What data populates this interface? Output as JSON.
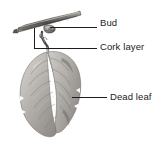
{
  "figure": {
    "background_color": "#ffffff",
    "ink_color": "#1c1c1c",
    "width": 161,
    "height": 153
  },
  "labels": [
    {
      "id": "bud",
      "text": "Bud",
      "leader": {
        "x1": 50,
        "y1": 27,
        "x2": 97,
        "y2": 27
      },
      "anchor": {
        "x": 50,
        "y": 27
      }
    },
    {
      "id": "cork-layer",
      "text": "Cork layer",
      "leader": {
        "x1": 34,
        "y1": 48,
        "x2": 97,
        "y2": 48
      },
      "bracket": {
        "x": 34,
        "y_top": 28,
        "y_bottom": 48
      },
      "anchor": {
        "x": 34,
        "y": 48
      }
    },
    {
      "id": "dead-leaf",
      "text": "Dead leaf",
      "leader": {
        "x1": 72,
        "y1": 97,
        "x2": 107,
        "y2": 97
      },
      "anchor": {
        "x": 72,
        "y": 97
      }
    }
  ],
  "illustration": {
    "parts": [
      {
        "name": "twig",
        "description": "horizontal woody stem across upper area"
      },
      {
        "name": "bud",
        "description": "small pointed bud on underside of twig"
      },
      {
        "name": "cork-layer",
        "description": "abscission zone at base of petiole"
      },
      {
        "name": "petiole",
        "description": "leaf stalk descending from twig"
      },
      {
        "name": "dead-leaf",
        "description": "withered hanging leaf blade with veins"
      }
    ]
  },
  "caption": {
    "text": ""
  }
}
